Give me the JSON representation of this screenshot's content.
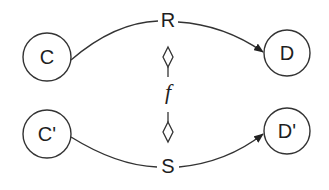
{
  "diagram": {
    "type": "mapping-diagram",
    "colors": {
      "stroke": "#333333",
      "text": "#1e1e1e",
      "background": "#ffffff"
    },
    "nodes": [
      {
        "id": "C",
        "label": "C"
      },
      {
        "id": "D",
        "label": "D"
      },
      {
        "id": "C_prime",
        "label": "C'"
      },
      {
        "id": "D_prime",
        "label": "D'"
      }
    ],
    "edges": [
      {
        "from": "C",
        "to": "D",
        "label": "R"
      },
      {
        "from": "C_prime",
        "to": "D_prime",
        "label": "S"
      }
    ],
    "mapping": {
      "label": "f",
      "connects": [
        "R",
        "S"
      ],
      "end_markers": "diamond"
    }
  }
}
